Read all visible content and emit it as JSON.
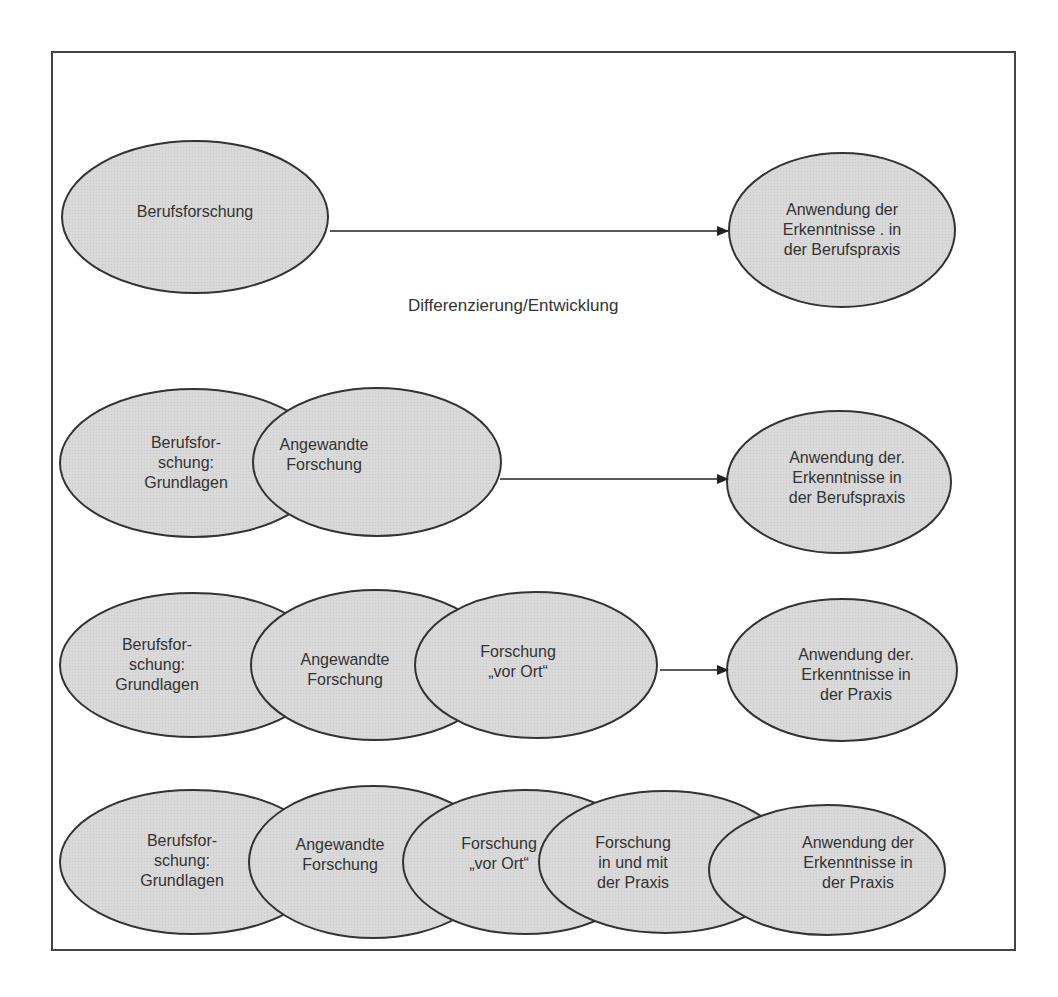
{
  "diagram": {
    "caption": "Differenzierung/Entwicklung",
    "colors": {
      "fill": "#d6d6d6",
      "stroke": "#333333",
      "text": "#333333",
      "frame": "#444444"
    },
    "rows": [
      {
        "nodes": [
          {
            "id": "r1n1",
            "label": "Berufsforschung",
            "cx": 195,
            "cy": 217,
            "rx": 133,
            "ry": 76,
            "tx": 195,
            "ty": 212
          },
          {
            "id": "r1n2",
            "label": "Anwendung der\nErkenntnisse . in\nder Berufspraxis",
            "cx": 842,
            "cy": 230,
            "rx": 113,
            "ry": 77,
            "tx": 842,
            "ty": 230
          }
        ],
        "arrow": {
          "x1": 330,
          "x2": 728,
          "y": 231
        }
      },
      {
        "nodes": [
          {
            "id": "r2n1",
            "label": "Berufsfor-\nschung:\nGrundlagen",
            "cx": 193,
            "cy": 463,
            "rx": 133,
            "ry": 74,
            "tx": 186,
            "ty": 463
          },
          {
            "id": "r2n2",
            "label": "Angewandte\nForschung",
            "cx": 377,
            "cy": 462,
            "rx": 124,
            "ry": 74,
            "tx": 324,
            "ty": 455
          },
          {
            "id": "r2n3",
            "label": "Anwendung der.\nErkenntnisse in\nder Berufspraxis",
            "cx": 839,
            "cy": 482,
            "rx": 112,
            "ry": 71,
            "tx": 847,
            "ty": 478
          }
        ],
        "arrow": {
          "x1": 500,
          "x2": 728,
          "y": 479
        }
      },
      {
        "nodes": [
          {
            "id": "r3n1",
            "label": "Berufsfor-\nschung:\nGrundlagen",
            "cx": 193,
            "cy": 665,
            "rx": 133,
            "ry": 72,
            "tx": 157,
            "ty": 665
          },
          {
            "id": "r3n2",
            "label": "Angewandte\nForschung",
            "cx": 375,
            "cy": 665,
            "rx": 124,
            "ry": 75,
            "tx": 345,
            "ty": 670
          },
          {
            "id": "r3n3",
            "label": "Forschung\n„vor Ort“",
            "cx": 536,
            "cy": 665,
            "rx": 121,
            "ry": 73,
            "tx": 518,
            "ty": 662
          },
          {
            "id": "r3n4",
            "label": "Anwendung der.\nErkenntnisse in\nder Praxis",
            "cx": 842,
            "cy": 670,
            "rx": 115,
            "ry": 71,
            "tx": 856,
            "ty": 675
          }
        ],
        "arrow": {
          "x1": 660,
          "x2": 728,
          "y": 670
        }
      },
      {
        "nodes": [
          {
            "id": "r4n1",
            "label": "Berufsfor-\nschung:\nGrundlagen",
            "cx": 193,
            "cy": 862,
            "rx": 133,
            "ry": 72,
            "tx": 182,
            "ty": 861
          },
          {
            "id": "r4n2",
            "label": "Angewandte\nForschung",
            "cx": 373,
            "cy": 862,
            "rx": 124,
            "ry": 76,
            "tx": 340,
            "ty": 855
          },
          {
            "id": "r4n3",
            "label": "Forschung\n„vor Ort“",
            "cx": 525,
            "cy": 862,
            "rx": 122,
            "ry": 72,
            "tx": 499,
            "ty": 854
          },
          {
            "id": "r4n4",
            "label": "Forschung\nin und mit\nder Praxis",
            "cx": 665,
            "cy": 862,
            "rx": 126,
            "ry": 71,
            "tx": 633,
            "ty": 863
          },
          {
            "id": "r4n5",
            "label": "Anwendung der\nErkenntnisse in\nder Praxis",
            "cx": 827,
            "cy": 870,
            "rx": 118,
            "ry": 65,
            "tx": 858,
            "ty": 863
          }
        ],
        "arrow": null
      }
    ]
  }
}
